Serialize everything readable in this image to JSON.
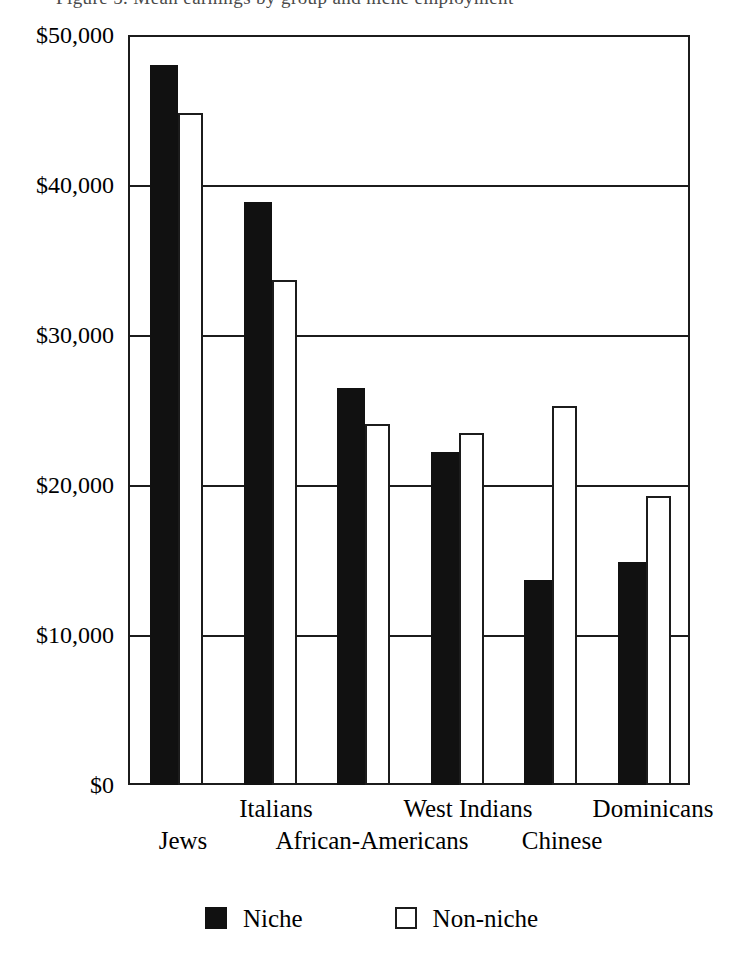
{
  "top_caption_fragment": "Figure 5. Mean earnings by group and niche employment",
  "chart_data": {
    "type": "bar",
    "title": "",
    "xlabel": "",
    "ylabel": "",
    "categories": [
      "Jews",
      "Italians",
      "African-Americans",
      "West Indians",
      "Chinese",
      "Dominicans"
    ],
    "series": [
      {
        "name": "Niche",
        "values": [
          48000,
          38900,
          26500,
          22200,
          13700,
          14900
        ]
      },
      {
        "name": "Non-niche",
        "values": [
          44800,
          33700,
          24100,
          23500,
          25300,
          19300
        ]
      }
    ],
    "ylim": [
      0,
      50000
    ],
    "ytick_values": [
      50000,
      40000,
      30000,
      20000,
      10000,
      0
    ],
    "ytick_labels": [
      "$50,000",
      "$40,000",
      "$30,000",
      "$20,000",
      "$10,000",
      "$0"
    ],
    "grid": true,
    "grid_axis": "y",
    "legend_position": "bottom",
    "colors": {
      "niche": "#111111",
      "non_niche": "#ffffff",
      "outline": "#1c1c1c",
      "background": "#ffffff"
    }
  },
  "legend": {
    "entries": [
      {
        "label": "Niche",
        "swatch": "filled-square-icon"
      },
      {
        "label": "Non-niche",
        "swatch": "hollow-square-icon"
      }
    ]
  },
  "axis": {
    "y_labels": [
      "$50,000",
      "$40,000",
      "$30,000",
      "$20,000",
      "$10,000",
      "$0"
    ],
    "x_labels_top_row": [
      "Italians",
      "West Indians",
      "Dominicans"
    ],
    "x_labels_bottom_row": [
      "Jews",
      "African-Americans",
      "Chinese"
    ]
  }
}
